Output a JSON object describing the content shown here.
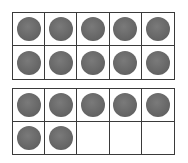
{
  "figure": {
    "counter_color": "#666666",
    "frames": [
      {
        "filled": 10,
        "total": 10
      },
      {
        "filled": 7,
        "total": 10
      }
    ],
    "total_counters": 17
  }
}
